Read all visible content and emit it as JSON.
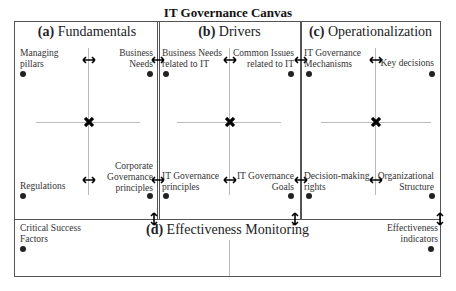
{
  "title": "IT Governance Canvas",
  "panels": {
    "a": {
      "letter": "(a)",
      "name": "Fundamentals",
      "tl": "Managing\npillars",
      "tr": "Business\nNeeds",
      "bl": "Regulations",
      "br": "Corporate\nGovernance\nprinciples"
    },
    "b": {
      "letter": "(b)",
      "name": "Drivers",
      "tl": "Business Needs\nrelated to IT",
      "tr": "Common Issues\nrelated to IT",
      "bl": "IT Governance\nprinciples",
      "br": "IT Governance\nGoals"
    },
    "c": {
      "letter": "(c)",
      "name": "Operationalization",
      "tl": "IT Governance\nMechanisms",
      "tr": "Key decisions",
      "bl": "Decision-making\nrights",
      "br": "Organizational\nStructure"
    },
    "d": {
      "letter": "(d)",
      "name": "Effectiveness Monitoring",
      "left": "Critical Success\nFactors",
      "right": "Effectiveness\nindicators"
    }
  }
}
